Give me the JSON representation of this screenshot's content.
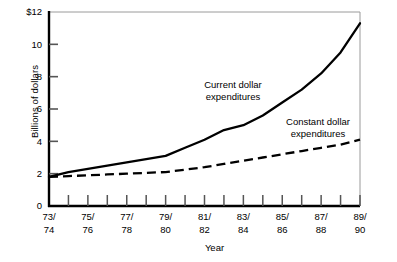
{
  "chart_data": {
    "type": "line",
    "title": "",
    "xlabel": "Year",
    "ylabel": "Billions of dollars",
    "ylim": [
      0,
      12
    ],
    "ytick_labels": [
      "0",
      "2",
      "4",
      "6",
      "8",
      "10",
      "$12"
    ],
    "ytick_values": [
      0,
      2,
      4,
      6,
      8,
      10,
      12
    ],
    "grid": false,
    "legend_position": "inline-annotations",
    "categories": [
      "73/74",
      "74/75",
      "75/76",
      "76/77",
      "77/78",
      "78/79",
      "79/80",
      "80/81",
      "81/82",
      "82/83",
      "83/84",
      "84/85",
      "85/86",
      "86/87",
      "87/88",
      "88/89",
      "89/90"
    ],
    "xtick_labels_shown": [
      "73/\n74",
      "75/\n76",
      "77/\n78",
      "79/\n80",
      "81/\n82",
      "83/\n84",
      "85/\n86",
      "87/\n88",
      "89/\n90"
    ],
    "xtick_labels_top": [
      "73/",
      "75/",
      "77/",
      "79/",
      "81/",
      "83/",
      "85/",
      "87/",
      "89/"
    ],
    "xtick_labels_bottom": [
      "74",
      "76",
      "78",
      "80",
      "82",
      "84",
      "86",
      "88",
      "90"
    ],
    "series": [
      {
        "name": "Current dollar expenditures",
        "style": "solid",
        "color": "#000000",
        "values": [
          1.8,
          2.1,
          2.3,
          2.5,
          2.7,
          2.9,
          3.1,
          3.6,
          4.1,
          4.7,
          5.0,
          5.6,
          6.4,
          7.2,
          8.2,
          9.5,
          11.3
        ]
      },
      {
        "name": "Constant dollar expenditures",
        "style": "dashed",
        "color": "#000000",
        "values": [
          1.8,
          1.85,
          1.9,
          1.95,
          2.0,
          2.05,
          2.1,
          2.25,
          2.4,
          2.6,
          2.8,
          3.0,
          3.2,
          3.4,
          3.6,
          3.8,
          4.1
        ]
      }
    ],
    "annotations": [
      {
        "text_line1": "Current dollar",
        "text_line2": "expenditures",
        "x_px": 233,
        "y_px": 88
      },
      {
        "text_line1": "Constant dollar",
        "text_line2": "expenditures",
        "x_px": 318,
        "y_px": 125
      }
    ]
  }
}
